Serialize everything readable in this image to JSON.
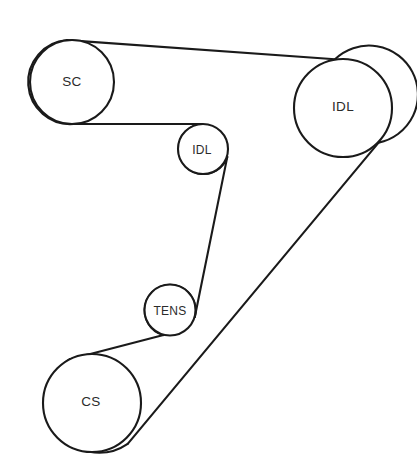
{
  "diagram": {
    "kind": "serpentine-belt-routing-diagram",
    "title": "",
    "background_color": "#ffffff",
    "line_color": "#1a1a1a",
    "label_color": "#2b2b2b",
    "stroke_width": 2.1,
    "canvas": {
      "width": 417,
      "height": 470
    },
    "pulleys": [
      {
        "id": "sc",
        "label": "SC",
        "name": "supercharger-pulley",
        "cx": 72,
        "cy": 82,
        "r": 42,
        "label_cx": 72,
        "label_cy": 81,
        "size": "large"
      },
      {
        "id": "idl-right",
        "label": "IDL",
        "name": "idler-pulley-right",
        "cx": 343,
        "cy": 108,
        "r": 49,
        "label_cx": 343,
        "label_cy": 106,
        "size": "large"
      },
      {
        "id": "idl-center",
        "label": "IDL",
        "name": "idler-pulley-center",
        "cx": 203,
        "cy": 149,
        "r": 25,
        "label_cx": 202,
        "label_cy": 150,
        "size": "small"
      },
      {
        "id": "tens",
        "label": "TENS",
        "name": "tensioner-pulley",
        "cx": 170,
        "cy": 310,
        "r": 25.5,
        "label_cx": 170,
        "label_cy": 311,
        "size": "small"
      },
      {
        "id": "cs",
        "label": "CS",
        "name": "crankshaft-pulley",
        "cx": 92,
        "cy": 403,
        "r": 49,
        "label_cx": 91,
        "label_cy": 401,
        "size": "large"
      }
    ],
    "belt_spans": [
      {
        "id": "span-sc-idlright-top",
        "name": "belt-span-sc-to-idler-right-top",
        "from": "sc",
        "to": "idl-right",
        "path": "M 67.1 40.1 L 335.0 59.2"
      },
      {
        "id": "span-idlright-cs",
        "name": "belt-span-idler-right-to-cs",
        "from": "idl-right",
        "to": "cs",
        "path": "M 378.6 142.6 L 127.7 443.8"
      },
      {
        "id": "span-cs-tens",
        "name": "belt-span-cs-to-tensioner",
        "from": "cs",
        "to": "tens",
        "path": "M 70.0 359.2 L 163.5 335.1"
      },
      {
        "id": "span-tens-idlcenter",
        "name": "belt-span-tensioner-to-idler-center",
        "from": "tens",
        "to": "idl-center",
        "path": "M 194.8 317.0 L 227.3 156.9"
      },
      {
        "id": "span-idlcenter-sc",
        "name": "belt-span-idler-center-to-sc",
        "from": "idl-center",
        "to": "sc",
        "path": "M 202.1 124.0 L 73.4 124.0"
      }
    ],
    "belt_wraps": [
      {
        "id": "wrap-sc",
        "name": "belt-wrap-sc",
        "pulley": "sc",
        "path": "M 67.1 40.1 A 42 42 0 1 0 73.4 124.0"
      },
      {
        "id": "wrap-idlright",
        "name": "belt-wrap-idler-right",
        "pulley": "idl-right",
        "path": "M 335.0 59.2 A 49 49 0 1 1 378.6 142.6"
      },
      {
        "id": "wrap-cs",
        "name": "belt-wrap-cs",
        "pulley": "cs",
        "path": "M 127.7 443.8 A 49 49 0 1 1 70.0 359.2"
      },
      {
        "id": "wrap-tens",
        "name": "belt-wrap-tensioner",
        "pulley": "tens",
        "path": "M 163.5 335.1 A 25.5 25.5 0 1 1 194.8 317.0"
      },
      {
        "id": "wrap-idlcenter",
        "name": "belt-wrap-idler-center",
        "pulley": "idl-center",
        "path": "M 227.3 156.9 A 25 25 0 1 1 202.1 124.0"
      }
    ]
  }
}
